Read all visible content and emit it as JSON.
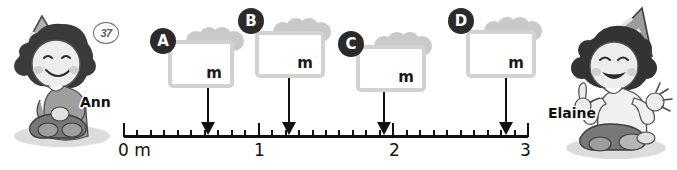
{
  "exercise": {
    "number": "37"
  },
  "characters": {
    "left": {
      "name": "Ann",
      "icon": "girl-kneeling-party-hat"
    },
    "right": {
      "name": "Elaine",
      "icon": "girl-kneeling-party-hat-hands-up"
    }
  },
  "gift_boxes": [
    {
      "badge": "A",
      "unit": "m",
      "value": "",
      "points_to": "0.55"
    },
    {
      "badge": "B",
      "unit": "m",
      "value": "",
      "points_to": "1.15"
    },
    {
      "badge": "C",
      "unit": "m",
      "value": "",
      "points_to": "1.85"
    },
    {
      "badge": "D",
      "unit": "m",
      "value": "",
      "points_to": "2.50"
    }
  ],
  "number_line": {
    "unit_label": "m",
    "major_labels": [
      "0",
      "1",
      "2",
      "3"
    ],
    "start_label": "0 m",
    "min": 0,
    "max": 3,
    "minor_per_unit": 10
  },
  "chart_data": {
    "type": "line",
    "title": "",
    "xlabel": "m",
    "ylabel": "",
    "x": [
      0.55,
      1.15,
      1.85,
      2.5
    ],
    "categories": [
      "A",
      "B",
      "C",
      "D"
    ],
    "values": [
      0.55,
      1.15,
      1.85,
      2.5
    ],
    "xlim": [
      0,
      3
    ],
    "tick_labels": [
      "0 m",
      "1",
      "2",
      "3"
    ],
    "minor_ticks_per_unit": 10,
    "grid": false,
    "legend": "none"
  }
}
